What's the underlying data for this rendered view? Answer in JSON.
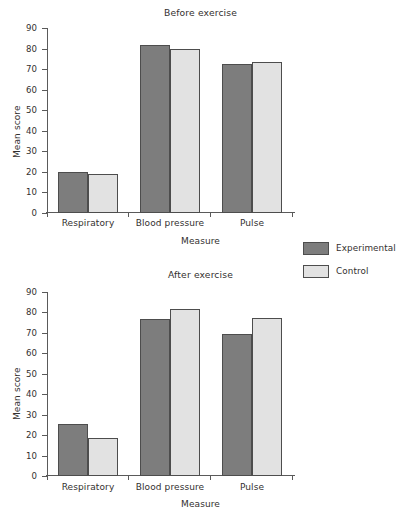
{
  "figure": {
    "legend": {
      "items": [
        {
          "label": "Experimental",
          "color": "#7d7d7d",
          "swatch_name": "legend-swatch-experimental"
        },
        {
          "label": "Control",
          "color": "#e2e2e2",
          "swatch_name": "legend-swatch-control"
        }
      ]
    }
  },
  "chart_data": [
    {
      "type": "bar",
      "title": "Before exercise",
      "xlabel": "Measure",
      "ylabel": "Mean score",
      "categories": [
        "Respiratory",
        "Blood pressure",
        "Pulse"
      ],
      "series": [
        {
          "name": "Experimental",
          "color": "#7d7d7d",
          "values": [
            20,
            81.5,
            72.5
          ]
        },
        {
          "name": "Control",
          "color": "#e2e2e2",
          "values": [
            19,
            80,
            73.5
          ]
        }
      ],
      "ylim": [
        0,
        90
      ],
      "yticks": [
        0,
        10,
        20,
        30,
        40,
        50,
        60,
        70,
        80,
        90
      ],
      "grid": false,
      "legend_position": "right"
    },
    {
      "type": "bar",
      "title": "After exercise",
      "xlabel": "Measure",
      "ylabel": "Mean score",
      "categories": [
        "Respiratory",
        "Blood pressure",
        "Pulse"
      ],
      "series": [
        {
          "name": "Experimental",
          "color": "#7d7d7d",
          "values": [
            25.5,
            77,
            69.5
          ]
        },
        {
          "name": "Control",
          "color": "#e2e2e2",
          "values": [
            18.5,
            81.5,
            77.5
          ]
        }
      ],
      "ylim": [
        0,
        90
      ],
      "yticks": [
        0,
        10,
        20,
        30,
        40,
        50,
        60,
        70,
        80,
        90
      ],
      "grid": false,
      "legend_position": "right"
    }
  ]
}
